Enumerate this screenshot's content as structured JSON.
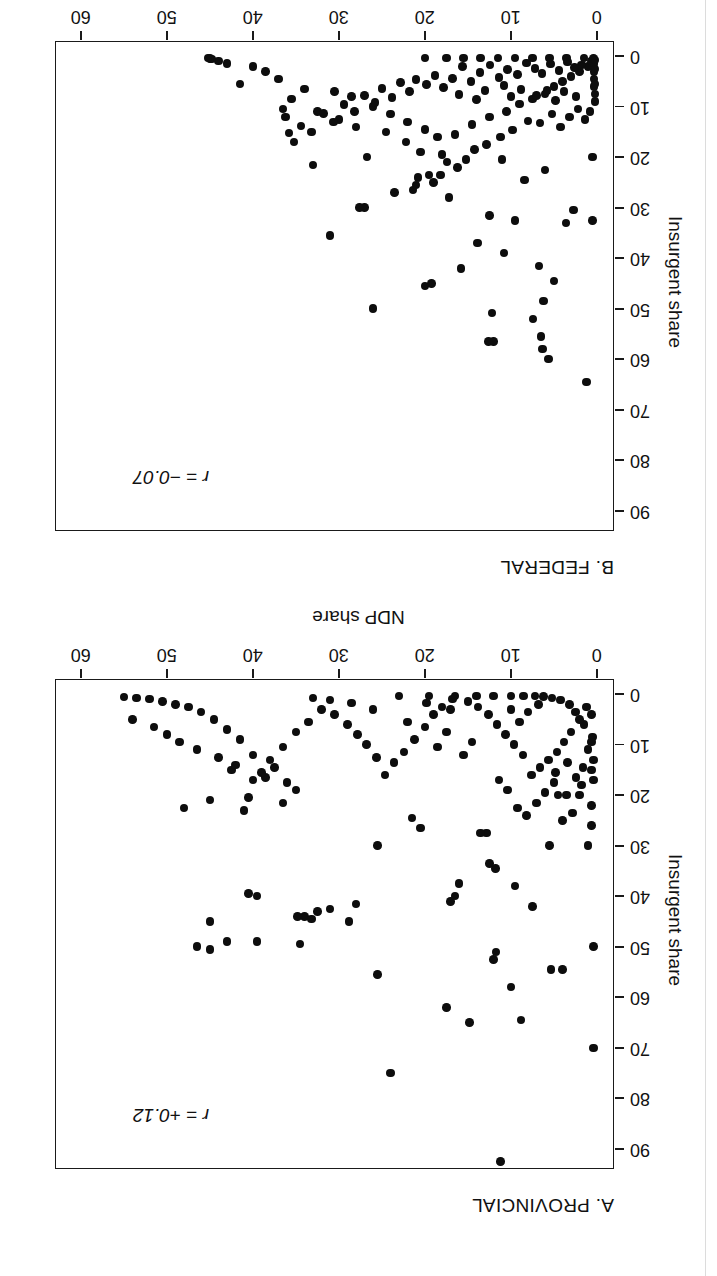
{
  "figure": {
    "background": "#ffffff",
    "point_color": "#0d0d0d",
    "axis_color": "#1a1a1a",
    "orientation_note": "page scanned upside-down; both panels rendered rotated 180 degrees"
  },
  "chart_data": [
    {
      "type": "scatter",
      "panel_id": "B",
      "title": "B. FEDERAL",
      "annotation": "r = −0.07",
      "annotation_r_symbol": "r",
      "annotation_equals": "=",
      "annotation_value": "−0.07",
      "xlabel": "NDP share",
      "ylabel": "Insurgent share",
      "xlim": [
        -2,
        63
      ],
      "ylim": [
        -3,
        94
      ],
      "xticks": [
        0,
        10,
        20,
        30,
        40,
        50,
        60
      ],
      "yticks": [
        0,
        10,
        20,
        30,
        40,
        50,
        60,
        70,
        80,
        90
      ],
      "xticklabels": [
        "0",
        "10",
        "20",
        "30",
        "40",
        "50",
        "60"
      ],
      "yticklabels": [
        "0",
        "10",
        "20",
        "30",
        "40",
        "50",
        "60",
        "70",
        "80",
        "90"
      ],
      "grid": false,
      "legend": false,
      "points": [
        [
          1.2,
          64.5
        ],
        [
          5.6,
          60.0
        ],
        [
          6.5,
          55.5
        ],
        [
          6.3,
          58.0
        ],
        [
          7.4,
          52.0
        ],
        [
          12.0,
          56.5
        ],
        [
          12.6,
          56.5
        ],
        [
          12.2,
          50.8
        ],
        [
          19.2,
          45.0
        ],
        [
          15.8,
          42.0
        ],
        [
          20.0,
          45.5
        ],
        [
          26.0,
          50.0
        ],
        [
          13.9,
          37.0
        ],
        [
          31.0,
          35.5
        ],
        [
          27.0,
          30.0
        ],
        [
          27.6,
          30.0
        ],
        [
          10.8,
          39.0
        ],
        [
          21.0,
          25.5
        ],
        [
          23.5,
          27.0
        ],
        [
          19.5,
          23.5
        ],
        [
          17.2,
          28.0
        ],
        [
          12.5,
          31.5
        ],
        [
          9.5,
          32.5
        ],
        [
          33.0,
          21.5
        ],
        [
          26.7,
          20.0
        ],
        [
          6.7,
          41.5
        ],
        [
          5.0,
          44.5
        ],
        [
          6.2,
          48.5
        ],
        [
          3.6,
          33.0
        ],
        [
          2.7,
          30.5
        ],
        [
          0.5,
          32.5
        ],
        [
          0.5,
          20.0
        ],
        [
          6.0,
          22.5
        ],
        [
          8.4,
          24.5
        ],
        [
          11.0,
          20.5
        ],
        [
          18.0,
          19.5
        ],
        [
          20.5,
          19.0
        ],
        [
          22.2,
          17.0
        ],
        [
          24.5,
          15.0
        ],
        [
          28.0,
          14.0
        ],
        [
          30.0,
          12.5
        ],
        [
          32.5,
          11.0
        ],
        [
          35.5,
          8.5
        ],
        [
          36.5,
          10.5
        ],
        [
          34.0,
          6.5
        ],
        [
          30.5,
          7.0
        ],
        [
          28.5,
          8.0
        ],
        [
          26.0,
          10.0
        ],
        [
          24.0,
          11.5
        ],
        [
          22.0,
          13.0
        ],
        [
          20.0,
          14.5
        ],
        [
          18.5,
          16.0
        ],
        [
          16.5,
          15.5
        ],
        [
          14.5,
          13.5
        ],
        [
          12.5,
          12.0
        ],
        [
          10.5,
          11.0
        ],
        [
          9.0,
          9.5
        ],
        [
          7.5,
          8.5
        ],
        [
          6.0,
          7.5
        ],
        [
          5.0,
          6.0
        ],
        [
          4.0,
          5.0
        ],
        [
          3.0,
          4.0
        ],
        [
          2.0,
          3.0
        ],
        [
          1.0,
          2.0
        ],
        [
          0.6,
          1.0
        ],
        [
          0.4,
          0.5
        ],
        [
          0.3,
          6.0
        ],
        [
          0.3,
          4.5
        ],
        [
          0.3,
          3.0
        ],
        [
          0.3,
          1.5
        ],
        [
          0.2,
          9.0
        ],
        [
          0.2,
          7.5
        ],
        [
          0.2,
          5.5
        ],
        [
          0.2,
          2.5
        ],
        [
          0.2,
          0.8
        ],
        [
          1.5,
          0.4
        ],
        [
          3.5,
          0.4
        ],
        [
          5.5,
          0.4
        ],
        [
          7.5,
          0.4
        ],
        [
          9.5,
          0.4
        ],
        [
          11.5,
          0.4
        ],
        [
          13.5,
          0.4
        ],
        [
          15.5,
          0.4
        ],
        [
          17.5,
          0.4
        ],
        [
          20.0,
          0.4
        ],
        [
          1.8,
          1.8
        ],
        [
          2.6,
          2.2
        ],
        [
          3.4,
          1.2
        ],
        [
          4.4,
          2.8
        ],
        [
          5.4,
          1.6
        ],
        [
          6.4,
          3.4
        ],
        [
          7.2,
          2.4
        ],
        [
          8.2,
          1.4
        ],
        [
          9.2,
          3.6
        ],
        [
          10.4,
          2.6
        ],
        [
          11.4,
          4.2
        ],
        [
          12.4,
          1.8
        ],
        [
          13.6,
          3.2
        ],
        [
          14.6,
          5.0
        ],
        [
          15.6,
          2.0
        ],
        [
          16.8,
          4.4
        ],
        [
          17.8,
          6.2
        ],
        [
          18.8,
          3.8
        ],
        [
          19.8,
          5.6
        ],
        [
          21.0,
          4.6
        ],
        [
          21.8,
          7.0
        ],
        [
          22.8,
          5.2
        ],
        [
          23.8,
          8.2
        ],
        [
          25.0,
          6.4
        ],
        [
          25.8,
          9.2
        ],
        [
          27.0,
          7.8
        ],
        [
          28.2,
          11.0
        ],
        [
          29.4,
          9.6
        ],
        [
          30.6,
          13.0
        ],
        [
          31.8,
          11.4
        ],
        [
          33.2,
          15.0
        ],
        [
          34.4,
          13.8
        ],
        [
          35.2,
          17.0
        ],
        [
          35.8,
          15.2
        ],
        [
          36.2,
          12.0
        ],
        [
          37.0,
          4.5
        ],
        [
          38.5,
          3.0
        ],
        [
          40.0,
          2.0
        ],
        [
          41.5,
          5.5
        ],
        [
          43.0,
          1.5
        ],
        [
          44.0,
          1.0
        ],
        [
          44.8,
          0.6
        ],
        [
          45.0,
          0.5
        ],
        [
          45.2,
          0.4
        ],
        [
          0.8,
          11.0
        ],
        [
          1.4,
          12.5
        ],
        [
          2.2,
          10.5
        ],
        [
          3.2,
          12.0
        ],
        [
          4.2,
          14.0
        ],
        [
          5.2,
          11.5
        ],
        [
          6.6,
          13.2
        ],
        [
          8.0,
          12.8
        ],
        [
          9.8,
          14.6
        ],
        [
          11.2,
          16.0
        ],
        [
          12.8,
          17.5
        ],
        [
          14.2,
          18.5
        ],
        [
          15.2,
          20.5
        ],
        [
          16.2,
          22.0
        ],
        [
          17.4,
          21.0
        ],
        [
          18.2,
          23.5
        ],
        [
          19.0,
          25.0
        ],
        [
          20.8,
          24.0
        ],
        [
          21.4,
          26.5
        ],
        [
          2.4,
          8.0
        ],
        [
          3.8,
          7.0
        ],
        [
          4.8,
          8.8
        ],
        [
          5.8,
          6.8
        ],
        [
          7.0,
          7.8
        ],
        [
          8.8,
          6.6
        ],
        [
          10.0,
          8.0
        ],
        [
          10.8,
          5.8
        ],
        [
          13.0,
          6.8
        ],
        [
          14.0,
          8.6
        ],
        [
          16.0,
          7.6
        ]
      ]
    },
    {
      "type": "scatter",
      "panel_id": "A",
      "title": "A. PROVINCIAL",
      "annotation": "r = +0.12",
      "annotation_r_symbol": "r",
      "annotation_equals": "=",
      "annotation_value": "+0.12",
      "xlabel": "NDP share",
      "ylabel": "Insurgent share",
      "xlim": [
        -2,
        63
      ],
      "ylim": [
        -3,
        94
      ],
      "xticks": [
        0,
        10,
        20,
        30,
        40,
        50,
        60
      ],
      "yticks": [
        0,
        10,
        20,
        30,
        40,
        50,
        60,
        70,
        80,
        90
      ],
      "xticklabels": [
        "0",
        "10",
        "20",
        "30",
        "40",
        "50",
        "60"
      ],
      "yticklabels": [
        "0",
        "10",
        "20",
        "30",
        "40",
        "50",
        "60",
        "70",
        "80",
        "90"
      ],
      "grid": false,
      "legend": false,
      "points": [
        [
          11.2,
          92.5
        ],
        [
          24.0,
          75.0
        ],
        [
          0.4,
          70.0
        ],
        [
          17.5,
          62.0
        ],
        [
          14.8,
          65.0
        ],
        [
          8.8,
          64.5
        ],
        [
          25.5,
          55.5
        ],
        [
          10.0,
          58.0
        ],
        [
          4.0,
          54.5
        ],
        [
          5.3,
          54.5
        ],
        [
          11.7,
          51.0
        ],
        [
          12.0,
          52.5
        ],
        [
          45.0,
          50.5
        ],
        [
          46.5,
          50.0
        ],
        [
          43.0,
          49.0
        ],
        [
          0.4,
          50.0
        ],
        [
          34.5,
          49.5
        ],
        [
          39.5,
          49.0
        ],
        [
          34.0,
          44.0
        ],
        [
          34.8,
          44.0
        ],
        [
          33.2,
          44.5
        ],
        [
          45.0,
          45.0
        ],
        [
          28.8,
          45.0
        ],
        [
          28.0,
          41.5
        ],
        [
          32.5,
          43.0
        ],
        [
          31.0,
          42.5
        ],
        [
          39.5,
          40.0
        ],
        [
          40.5,
          39.5
        ],
        [
          7.5,
          42.0
        ],
        [
          9.5,
          38.0
        ],
        [
          17.0,
          41.0
        ],
        [
          16.5,
          40.0
        ],
        [
          16.0,
          37.5
        ],
        [
          11.8,
          34.5
        ],
        [
          12.5,
          33.5
        ],
        [
          1.0,
          30.0
        ],
        [
          5.5,
          30.0
        ],
        [
          25.5,
          30.0
        ],
        [
          20.5,
          26.5
        ],
        [
          21.5,
          24.5
        ],
        [
          12.8,
          27.5
        ],
        [
          13.5,
          27.5
        ],
        [
          48.0,
          22.5
        ],
        [
          45.0,
          21.0
        ],
        [
          41.0,
          23.0
        ],
        [
          40.5,
          20.5
        ],
        [
          36.5,
          21.5
        ],
        [
          35.0,
          19.0
        ],
        [
          38.5,
          16.5
        ],
        [
          42.5,
          15.0
        ],
        [
          3.5,
          20.0
        ],
        [
          4.5,
          20.0
        ],
        [
          2.0,
          20.0
        ],
        [
          0.4,
          17.0
        ],
        [
          0.4,
          13.0
        ],
        [
          0.5,
          8.5
        ],
        [
          1.5,
          6.0
        ],
        [
          2.5,
          3.5
        ],
        [
          3.2,
          2.0
        ],
        [
          4.2,
          1.2
        ],
        [
          5.2,
          0.8
        ],
        [
          6.2,
          0.5
        ],
        [
          7.2,
          0.4
        ],
        [
          8.5,
          0.4
        ],
        [
          10.0,
          0.4
        ],
        [
          12.0,
          0.4
        ],
        [
          14.0,
          0.4
        ],
        [
          16.5,
          0.4
        ],
        [
          19.5,
          0.4
        ],
        [
          23.0,
          0.4
        ],
        [
          1.2,
          2.5
        ],
        [
          2.0,
          5.0
        ],
        [
          3.0,
          7.5
        ],
        [
          3.8,
          9.5
        ],
        [
          4.6,
          11.5
        ],
        [
          5.6,
          13.0
        ],
        [
          6.6,
          14.5
        ],
        [
          7.6,
          16.0
        ],
        [
          8.6,
          12.0
        ],
        [
          9.6,
          10.0
        ],
        [
          10.6,
          8.0
        ],
        [
          11.6,
          6.0
        ],
        [
          12.6,
          4.0
        ],
        [
          13.8,
          2.5
        ],
        [
          15.0,
          1.5
        ],
        [
          16.8,
          1.0
        ],
        [
          18.0,
          2.5
        ],
        [
          19.0,
          4.0
        ],
        [
          20.0,
          6.5
        ],
        [
          21.2,
          9.0
        ],
        [
          22.4,
          11.5
        ],
        [
          23.6,
          13.5
        ],
        [
          24.6,
          16.0
        ],
        [
          25.6,
          12.5
        ],
        [
          26.8,
          10.0
        ],
        [
          27.8,
          8.0
        ],
        [
          29.0,
          6.0
        ],
        [
          30.5,
          4.0
        ],
        [
          32.0,
          3.0
        ],
        [
          33.5,
          5.5
        ],
        [
          35.0,
          7.5
        ],
        [
          36.5,
          10.5
        ],
        [
          38.0,
          13.0
        ],
        [
          39.0,
          15.5
        ],
        [
          40.0,
          12.0
        ],
        [
          41.5,
          9.0
        ],
        [
          43.0,
          7.0
        ],
        [
          44.5,
          5.0
        ],
        [
          46.0,
          3.5
        ],
        [
          47.5,
          2.5
        ],
        [
          49.0,
          2.0
        ],
        [
          50.5,
          1.5
        ],
        [
          52.0,
          1.0
        ],
        [
          53.5,
          0.8
        ],
        [
          55.0,
          0.6
        ],
        [
          54.0,
          5.0
        ],
        [
          51.5,
          6.5
        ],
        [
          50.0,
          8.0
        ],
        [
          48.5,
          9.5
        ],
        [
          46.5,
          11.0
        ],
        [
          44.0,
          12.5
        ],
        [
          42.0,
          14.0
        ],
        [
          40.0,
          17.0
        ],
        [
          37.5,
          14.5
        ],
        [
          36.0,
          17.5
        ],
        [
          0.6,
          4.0
        ],
        [
          0.6,
          9.5
        ],
        [
          0.6,
          15.0
        ],
        [
          0.6,
          22.0
        ],
        [
          0.6,
          26.0
        ],
        [
          1.8,
          18.0
        ],
        [
          2.8,
          23.5
        ],
        [
          4.0,
          25.0
        ],
        [
          5.0,
          17.5
        ],
        [
          6.0,
          19.5
        ],
        [
          7.0,
          21.5
        ],
        [
          8.2,
          24.0
        ],
        [
          9.2,
          22.5
        ],
        [
          10.4,
          19.0
        ],
        [
          11.4,
          17.0
        ],
        [
          1.0,
          11.0
        ],
        [
          1.6,
          14.5
        ],
        [
          2.4,
          16.5
        ],
        [
          3.4,
          13.5
        ],
        [
          4.8,
          15.5
        ],
        [
          14.5,
          9.5
        ],
        [
          15.5,
          12.0
        ],
        [
          17.5,
          7.5
        ],
        [
          18.5,
          10.5
        ],
        [
          22.0,
          5.5
        ],
        [
          26.0,
          3.0
        ],
        [
          28.5,
          1.8
        ],
        [
          31.0,
          1.2
        ],
        [
          33.0,
          0.8
        ],
        [
          17.0,
          3.0
        ],
        [
          19.8,
          1.8
        ],
        [
          6.8,
          2.0
        ],
        [
          8.0,
          3.5
        ],
        [
          9.0,
          5.5
        ],
        [
          10.0,
          3.0
        ]
      ]
    }
  ]
}
